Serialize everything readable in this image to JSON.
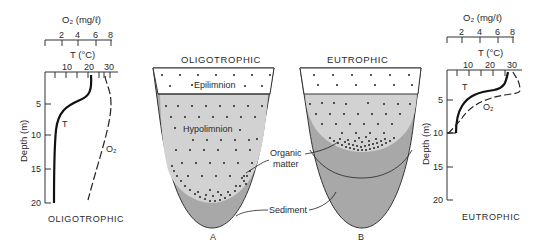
{
  "left_profile": {
    "o2_axis_label": "O₂ (mg/ℓ)",
    "o2_ticks": [
      "2",
      "4",
      "6",
      "8"
    ],
    "t_axis_label": "T (°C)",
    "t_ticks": [
      "10",
      "20",
      "30"
    ],
    "depth_label": "Depth (m)",
    "depth_ticks": [
      "5",
      "10",
      "15",
      "20"
    ],
    "curve_t_label": "T",
    "curve_o2_label": "O₂",
    "caption": "OLIGOTROPHIC"
  },
  "right_profile": {
    "o2_axis_label": "O₂ (mg/ℓ)",
    "o2_ticks": [
      "2",
      "4",
      "6",
      "8"
    ],
    "t_axis_label": "T (°C)",
    "t_ticks": [
      "10",
      "20",
      "30"
    ],
    "depth_label": "Depth (m)",
    "depth_ticks": [
      "5",
      "10",
      "15",
      "20"
    ],
    "curve_t_label": "T",
    "curve_o2_label": "O₂",
    "caption": "EUTROPHIC"
  },
  "lake_a": {
    "title": "OLIGOTROPHIC",
    "epilimnion_label": "Epilimnion",
    "hypolimnion_label": "Hypolimnion",
    "letter": "A"
  },
  "lake_b": {
    "title": "EUTROPHIC",
    "letter": "B"
  },
  "callouts": {
    "organic_line1": "Organic",
    "organic_line2": "matter",
    "sediment": "Sediment"
  },
  "colors": {
    "water": "#d2d2d2",
    "sediment": "#a8a8a8",
    "epilimnion": "#ffffff",
    "line": "#222222"
  }
}
